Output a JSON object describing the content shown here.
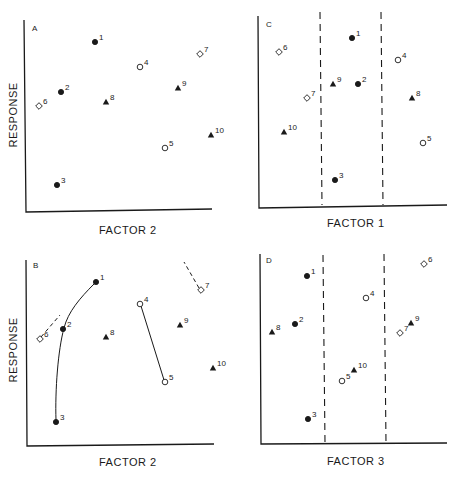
{
  "figure": {
    "ylabel": "RESPONSE",
    "panels": [
      {
        "id": "A",
        "label": "A",
        "xlabel": "FACTOR 2"
      },
      {
        "id": "C",
        "label": "C",
        "xlabel": "FACTOR 1"
      },
      {
        "id": "B",
        "label": "B",
        "xlabel": "FACTOR 2"
      },
      {
        "id": "D",
        "label": "D",
        "xlabel": "FACTOR 3"
      }
    ]
  },
  "chart_data": [
    {
      "type": "scatter",
      "title": "A",
      "xlabel": "FACTOR 2",
      "ylabel": "RESPONSE",
      "marker_legend": {
        "filled-circle": [
          1,
          2,
          3
        ],
        "open-circle": [
          4,
          5
        ],
        "open-diamond": [
          6,
          7
        ],
        "filled-triangle": [
          8,
          9,
          10
        ]
      },
      "points": [
        {
          "id": "1",
          "marker": "filled-circle",
          "x": 95,
          "y": 42
        },
        {
          "id": "2",
          "marker": "filled-circle",
          "x": 61,
          "y": 92
        },
        {
          "id": "3",
          "marker": "filled-circle",
          "x": 57,
          "y": 185
        },
        {
          "id": "4",
          "marker": "open-circle",
          "x": 140,
          "y": 67
        },
        {
          "id": "5",
          "marker": "open-circle",
          "x": 165,
          "y": 148
        },
        {
          "id": "6",
          "marker": "open-diamond",
          "x": 39,
          "y": 106
        },
        {
          "id": "7",
          "marker": "open-diamond",
          "x": 200,
          "y": 54
        },
        {
          "id": "8",
          "marker": "filled-triangle",
          "x": 106,
          "y": 102
        },
        {
          "id": "9",
          "marker": "filled-triangle",
          "x": 178,
          "y": 88
        },
        {
          "id": "10",
          "marker": "filled-triangle",
          "x": 211,
          "y": 135
        }
      ]
    },
    {
      "type": "scatter",
      "title": "C",
      "xlabel": "FACTOR 1",
      "ylabel": "",
      "partitions": 3,
      "points": [
        {
          "id": "1",
          "marker": "filled-circle",
          "x": 352,
          "y": 38
        },
        {
          "id": "2",
          "marker": "filled-circle",
          "x": 358,
          "y": 84
        },
        {
          "id": "3",
          "marker": "filled-circle",
          "x": 335,
          "y": 180
        },
        {
          "id": "4",
          "marker": "open-circle",
          "x": 398,
          "y": 60
        },
        {
          "id": "5",
          "marker": "open-circle",
          "x": 423,
          "y": 143
        },
        {
          "id": "6",
          "marker": "open-diamond",
          "x": 279,
          "y": 52
        },
        {
          "id": "7",
          "marker": "open-diamond",
          "x": 307,
          "y": 98
        },
        {
          "id": "8",
          "marker": "filled-triangle",
          "x": 412,
          "y": 98
        },
        {
          "id": "9",
          "marker": "filled-triangle",
          "x": 333,
          "y": 84
        },
        {
          "id": "10",
          "marker": "filled-triangle",
          "x": 284,
          "y": 132
        }
      ]
    },
    {
      "type": "scatter",
      "title": "B",
      "xlabel": "FACTOR 2",
      "ylabel": "RESPONSE",
      "connections": [
        [
          "1",
          "2",
          "3"
        ],
        [
          "4",
          "5"
        ],
        [
          "6",
          "dash"
        ],
        [
          "7",
          "dash"
        ]
      ],
      "points": [
        {
          "id": "1",
          "marker": "filled-circle",
          "x": 96,
          "y": 282
        },
        {
          "id": "2",
          "marker": "filled-circle",
          "x": 63,
          "y": 329
        },
        {
          "id": "3",
          "marker": "filled-circle",
          "x": 56,
          "y": 422
        },
        {
          "id": "4",
          "marker": "open-circle",
          "x": 140,
          "y": 304
        },
        {
          "id": "5",
          "marker": "open-circle",
          "x": 165,
          "y": 382
        },
        {
          "id": "6",
          "marker": "open-diamond",
          "x": 40,
          "y": 339
        },
        {
          "id": "7",
          "marker": "open-diamond",
          "x": 201,
          "y": 290
        },
        {
          "id": "8",
          "marker": "filled-triangle",
          "x": 106,
          "y": 337
        },
        {
          "id": "9",
          "marker": "filled-triangle",
          "x": 180,
          "y": 325
        },
        {
          "id": "10",
          "marker": "filled-triangle",
          "x": 213,
          "y": 368
        }
      ]
    },
    {
      "type": "scatter",
      "title": "D",
      "xlabel": "FACTOR 3",
      "ylabel": "",
      "partitions": 3,
      "points": [
        {
          "id": "1",
          "marker": "filled-circle",
          "x": 307,
          "y": 276
        },
        {
          "id": "2",
          "marker": "filled-circle",
          "x": 295,
          "y": 324
        },
        {
          "id": "3",
          "marker": "filled-circle",
          "x": 308,
          "y": 419
        },
        {
          "id": "4",
          "marker": "open-circle",
          "x": 366,
          "y": 298
        },
        {
          "id": "5",
          "marker": "open-circle",
          "x": 342,
          "y": 381
        },
        {
          "id": "6",
          "marker": "open-diamond",
          "x": 424,
          "y": 264
        },
        {
          "id": "7",
          "marker": "open-diamond",
          "x": 400,
          "y": 333
        },
        {
          "id": "8",
          "marker": "filled-triangle",
          "x": 272,
          "y": 332
        },
        {
          "id": "9",
          "marker": "filled-triangle",
          "x": 411,
          "y": 323
        },
        {
          "id": "10",
          "marker": "filled-triangle",
          "x": 354,
          "y": 370
        }
      ]
    }
  ]
}
